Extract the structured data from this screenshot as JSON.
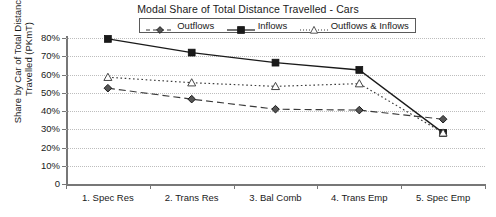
{
  "chart_data": {
    "type": "line",
    "title": "Modal Share of Total Distance Travelled - Cars",
    "xlabel": "",
    "ylabel": "Share by Car of Total Distance Travelled (PKmT)",
    "ylabel_line1": "Share by Car of Total Distance",
    "ylabel_line2": "Travelled (PKmT)",
    "categories": [
      "1. Spec Res",
      "2. Trans Res",
      "3. Bal Comb",
      "4. Trans Emp",
      "5. Spec Emp"
    ],
    "ylim": [
      0,
      80
    ],
    "ytick_labels": [
      "80%",
      "70%",
      "60%",
      "50%",
      "40%",
      "30%",
      "20%",
      "10%",
      "0"
    ],
    "ytick_values": [
      80,
      70,
      60,
      50,
      40,
      30,
      20,
      10,
      0
    ],
    "grid": true,
    "legend_position": "top-center",
    "series": [
      {
        "name": "Outflows",
        "marker": "diamond",
        "line_style": "dashed",
        "color": "#3a3a3a",
        "values": [
          52.5,
          46.5,
          41,
          40.5,
          35.5
        ]
      },
      {
        "name": "Inflows",
        "marker": "square",
        "line_style": "solid",
        "color": "#1a1a1a",
        "values": [
          79.5,
          72,
          66.5,
          62.5,
          28
        ]
      },
      {
        "name": "Outflows & Inflows",
        "marker": "triangle",
        "line_style": "dotted",
        "color": "#3a3a3a",
        "values": [
          58.5,
          55.5,
          53.5,
          55,
          28
        ]
      }
    ]
  },
  "legend": {
    "items": [
      {
        "label": "Outflows"
      },
      {
        "label": "Inflows"
      },
      {
        "label": "Outflows & Inflows"
      }
    ]
  }
}
